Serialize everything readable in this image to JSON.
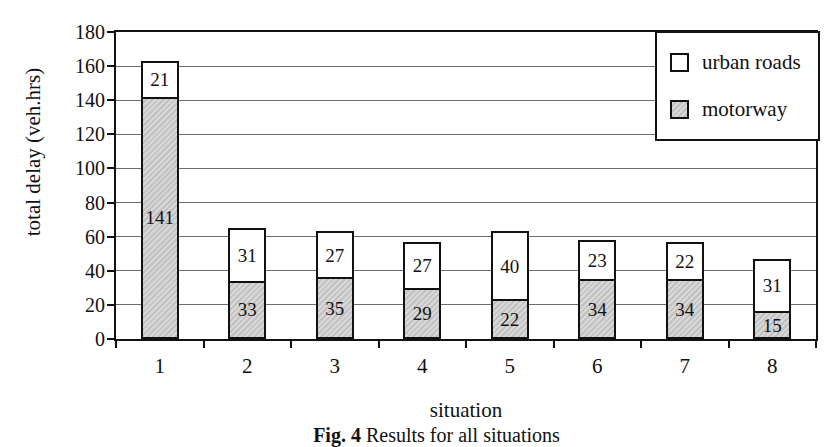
{
  "figure": {
    "caption_prefix": "Fig. 4",
    "caption_text": " Results for all situations"
  },
  "chart_data": {
    "type": "bar",
    "stacked": true,
    "title": "",
    "xlabel": "situation",
    "ylabel": "total delay (veh.hrs)",
    "categories": [
      "1",
      "2",
      "3",
      "4",
      "5",
      "6",
      "7",
      "8"
    ],
    "series": [
      {
        "name": "motorway",
        "values": [
          141,
          33,
          35,
          29,
          22,
          34,
          34,
          15
        ],
        "fill": "#cccccc",
        "pattern": "hatch"
      },
      {
        "name": "urban roads",
        "values": [
          21,
          31,
          27,
          27,
          40,
          23,
          22,
          31
        ],
        "fill": "#ffffff",
        "pattern": "none"
      }
    ],
    "ylim": [
      0,
      180
    ],
    "yticks": [
      0,
      20,
      40,
      60,
      80,
      100,
      120,
      140,
      160,
      180
    ],
    "grid": "horizontal",
    "bar_labels": "inside-segments",
    "legend_position": "top-right",
    "legend_items": [
      {
        "label": "urban roads",
        "fill": "#ffffff",
        "pattern": "none"
      },
      {
        "label": "motorway",
        "fill": "#cccccc",
        "pattern": "hatch"
      }
    ],
    "colors": {
      "axis": "#111111",
      "gridline": "#6e6e6e",
      "hatch_light": "#d8d8d8",
      "hatch_dark": "#c2c2c2"
    }
  }
}
